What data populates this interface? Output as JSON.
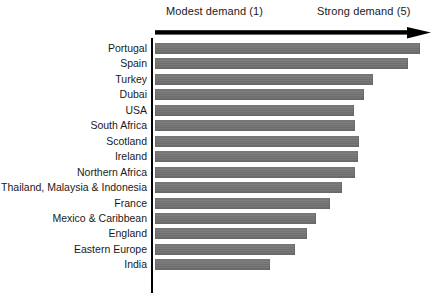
{
  "header": {
    "left_caption": "Modest demand (1)",
    "right_caption": "Strong demand (5)",
    "arrow_icon": "right-arrow-icon"
  },
  "chart_data": {
    "type": "bar",
    "orientation": "horizontal",
    "title": "",
    "subtitle": "",
    "xlabel": "",
    "ylabel": "",
    "xlim": [
      1,
      5
    ],
    "grid": false,
    "legend": null,
    "axis_annotations": {
      "low_end": "Modest demand (1)",
      "high_end": "Strong demand (5)"
    },
    "bar_color": "#747474",
    "axis_color": "#000000",
    "categories": [
      "Portugal",
      "Spain",
      "Turkey",
      "Dubai",
      "USA",
      "South Africa",
      "Scotland",
      "Ireland",
      "Northern Africa",
      "Thailand, Malaysia & Indonesia",
      "France",
      "Mexico & Caribbean",
      "England",
      "Eastern Europe",
      "India"
    ],
    "values": [
      4.8,
      4.6,
      4.2,
      4.0,
      3.8,
      3.8,
      3.8,
      3.8,
      3.7,
      3.7,
      3.4,
      3.2,
      3.0,
      2.8,
      2.4
    ],
    "bar_pixel_widths": [
      265,
      253,
      218,
      209,
      199,
      200,
      204,
      203,
      200,
      187,
      175,
      161,
      152,
      140,
      115
    ],
    "max_pixel_width": 276
  },
  "accessibility": {
    "chart_name": "demand-by-destination-bar-chart"
  }
}
